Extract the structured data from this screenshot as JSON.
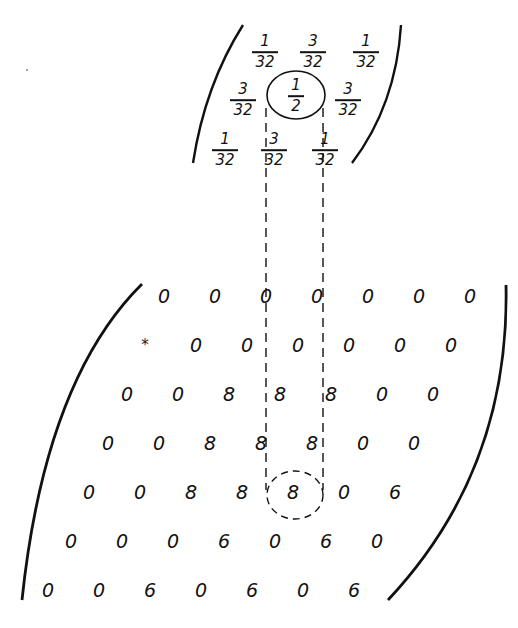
{
  "kernel": {
    "rows": [
      [
        {
          "num": "1",
          "den": "32"
        },
        {
          "num": "3",
          "den": "32"
        },
        {
          "num": "1",
          "den": "32"
        }
      ],
      [
        {
          "num": "3",
          "den": "32"
        },
        {
          "num": "1",
          "den": "2",
          "circled": true
        },
        {
          "num": "3",
          "den": "32"
        }
      ],
      [
        {
          "num": "1",
          "den": "32"
        },
        {
          "num": "3",
          "den": "32"
        },
        {
          "num": "1",
          "den": "32"
        }
      ]
    ]
  },
  "matrix": {
    "rows": [
      [
        "0",
        "0",
        "0",
        "0",
        "0",
        "0",
        "0"
      ],
      [
        "*",
        "0",
        "0",
        "0",
        "0",
        "0",
        "0"
      ],
      [
        "0",
        "0",
        "8",
        "8",
        "8",
        "0",
        "0"
      ],
      [
        "0",
        "0",
        "8",
        "8",
        "8",
        "0",
        "0"
      ],
      [
        "0",
        "0",
        "8",
        "8",
        "8",
        "0",
        "6"
      ],
      [
        "0",
        "0",
        "0",
        "6",
        "0",
        "6",
        "0"
      ],
      [
        "0",
        "0",
        "6",
        "0",
        "6",
        "0",
        "6"
      ]
    ],
    "highlighted_cell": {
      "row": 4,
      "col": 4,
      "value": "8"
    }
  },
  "colors": {
    "ink": "#111111",
    "background": "#ffffff"
  }
}
